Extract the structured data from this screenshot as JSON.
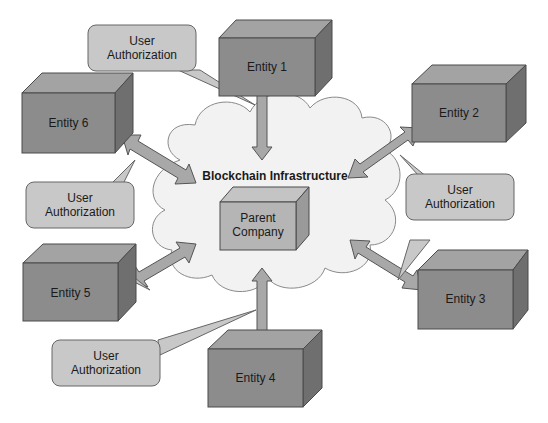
{
  "diagram": {
    "cloud_label": "Blockchain Infrastructure",
    "center": {
      "label_line1": "Parent",
      "label_line2": "Company"
    },
    "entities": [
      {
        "id": 1,
        "label": "Entity 1"
      },
      {
        "id": 2,
        "label": "Entity 2"
      },
      {
        "id": 3,
        "label": "Entity 3"
      },
      {
        "id": 4,
        "label": "Entity 4"
      },
      {
        "id": 5,
        "label": "Entity 5"
      },
      {
        "id": 6,
        "label": "Entity 6"
      }
    ],
    "callouts": [
      {
        "line1": "User",
        "line2": "Authorization"
      },
      {
        "line1": "User",
        "line2": "Authorization"
      },
      {
        "line1": "User",
        "line2": "Authorization"
      },
      {
        "line1": "User",
        "line2": "Authorization"
      }
    ],
    "colors": {
      "box_front": "#8c8c8c",
      "box_top": "#a3a3a3",
      "box_side": "#6f6f6f",
      "center_front": "#b5b5b5",
      "callout_fill": "#c8c8c8",
      "arrow_fill": "#a8a8a8",
      "cloud_fill": "#f2f2f2",
      "stroke": "#4a4a4a"
    }
  }
}
